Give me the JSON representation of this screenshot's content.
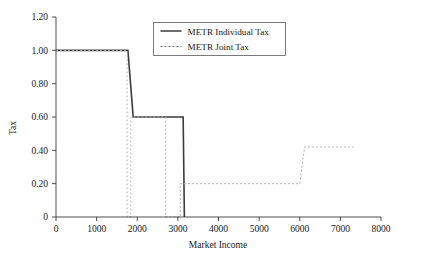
{
  "chart_data": {
    "type": "line",
    "title": "",
    "xlabel": "Market Income",
    "ylabel": "Tax",
    "xlim": [
      0,
      8000
    ],
    "ylim": [
      0,
      1.2
    ],
    "grid": false,
    "legend_position": "top-center",
    "x_ticks": [
      "0",
      "1000",
      "2000",
      "3000",
      "4000",
      "5000",
      "6000",
      "7000",
      "8000"
    ],
    "x_tick_values": [
      0,
      1000,
      2000,
      3000,
      4000,
      5000,
      6000,
      7000,
      8000
    ],
    "y_ticks": [
      "0",
      "0.20",
      "0.40",
      "0.60",
      "0.80",
      "1.00",
      "1.20"
    ],
    "y_tick_values": [
      0,
      0.2,
      0.4,
      0.6,
      0.8,
      1.0,
      1.2
    ],
    "series": [
      {
        "name": "METR Individual Tax",
        "style": "solid",
        "color": "#3b3b3b",
        "points": [
          [
            0,
            1.0
          ],
          [
            1770,
            1.0
          ],
          [
            1900,
            0.6
          ],
          [
            3130,
            0.6
          ],
          [
            3160,
            0.0
          ]
        ]
      },
      {
        "name": "METR Joint Tax",
        "style": "dashed",
        "color": "#b4b4b4",
        "points": [
          [
            0,
            1.0
          ],
          [
            1750,
            1.0
          ],
          [
            1750,
            0.0
          ],
          [
            1840,
            0.0
          ],
          [
            1840,
            0.6
          ],
          [
            2700,
            0.6
          ],
          [
            2700,
            0.0
          ],
          [
            3060,
            0.0
          ],
          [
            3060,
            0.2
          ],
          [
            6000,
            0.2
          ],
          [
            6120,
            0.42
          ],
          [
            7320,
            0.42
          ]
        ]
      }
    ]
  },
  "legend": {
    "entries": [
      {
        "label": "METR Individual Tax",
        "style": "solid"
      },
      {
        "label": "METR Joint Tax",
        "style": "dashed"
      }
    ]
  }
}
